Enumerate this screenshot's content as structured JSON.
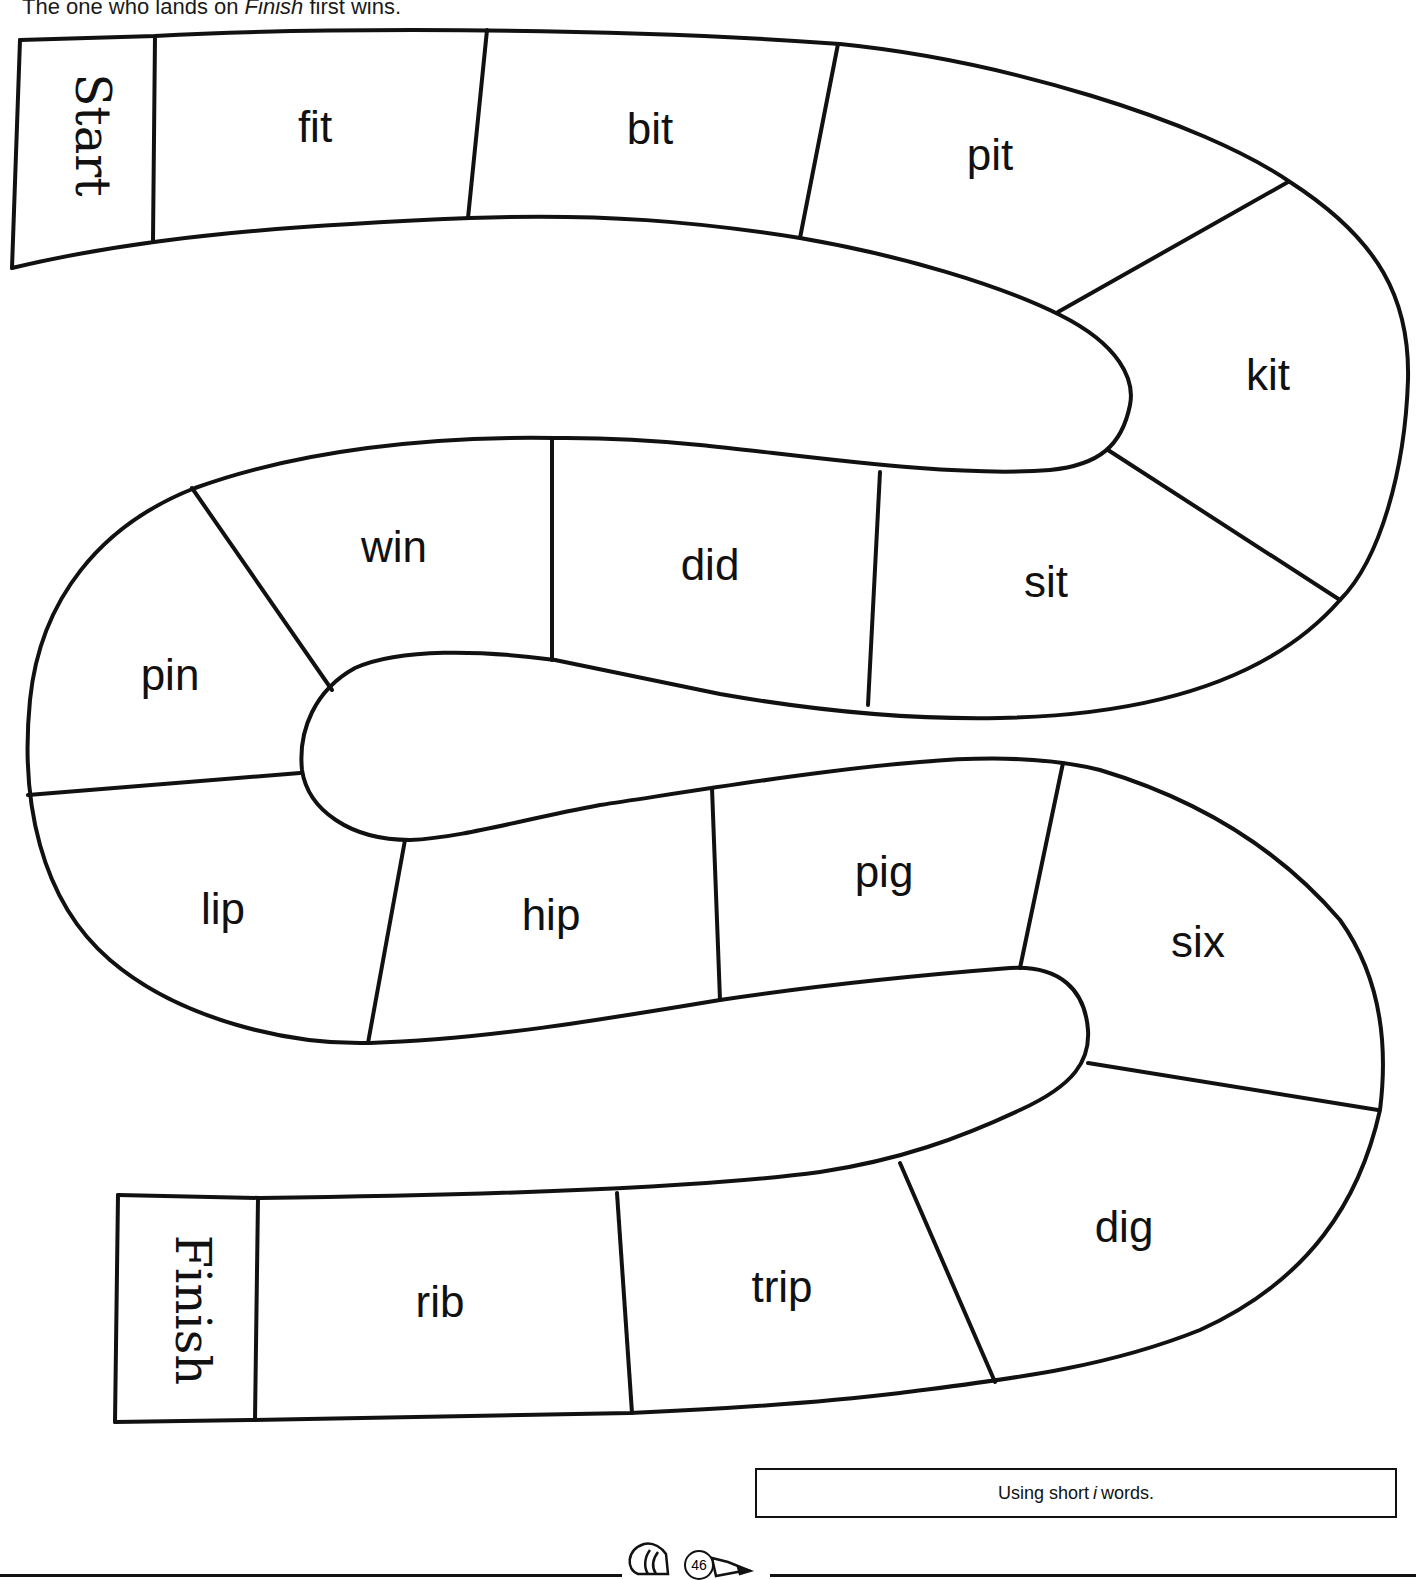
{
  "instructions": {
    "prefix": "The one who lands on ",
    "emphasis": "Finish",
    "suffix": " first wins."
  },
  "board": {
    "start_label": "Start",
    "finish_label": "Finish",
    "spaces": [
      {
        "index": 1,
        "word": "fit"
      },
      {
        "index": 2,
        "word": "bit"
      },
      {
        "index": 3,
        "word": "pit"
      },
      {
        "index": 4,
        "word": "kit"
      },
      {
        "index": 5,
        "word": "sit"
      },
      {
        "index": 6,
        "word": "did"
      },
      {
        "index": 7,
        "word": "win"
      },
      {
        "index": 8,
        "word": "pin"
      },
      {
        "index": 9,
        "word": "lip"
      },
      {
        "index": 10,
        "word": "hip"
      },
      {
        "index": 11,
        "word": "pig"
      },
      {
        "index": 12,
        "word": "six"
      },
      {
        "index": 13,
        "word": "dig"
      },
      {
        "index": 14,
        "word": "trip"
      },
      {
        "index": 15,
        "word": "rib"
      }
    ],
    "colors": {
      "line": "#111111",
      "background": "#ffffff"
    }
  },
  "caption": {
    "prefix": "Using short ",
    "emphasis": "i",
    "suffix": " words."
  },
  "footer": {
    "page_number": "46",
    "icon": "pencil-icon"
  }
}
